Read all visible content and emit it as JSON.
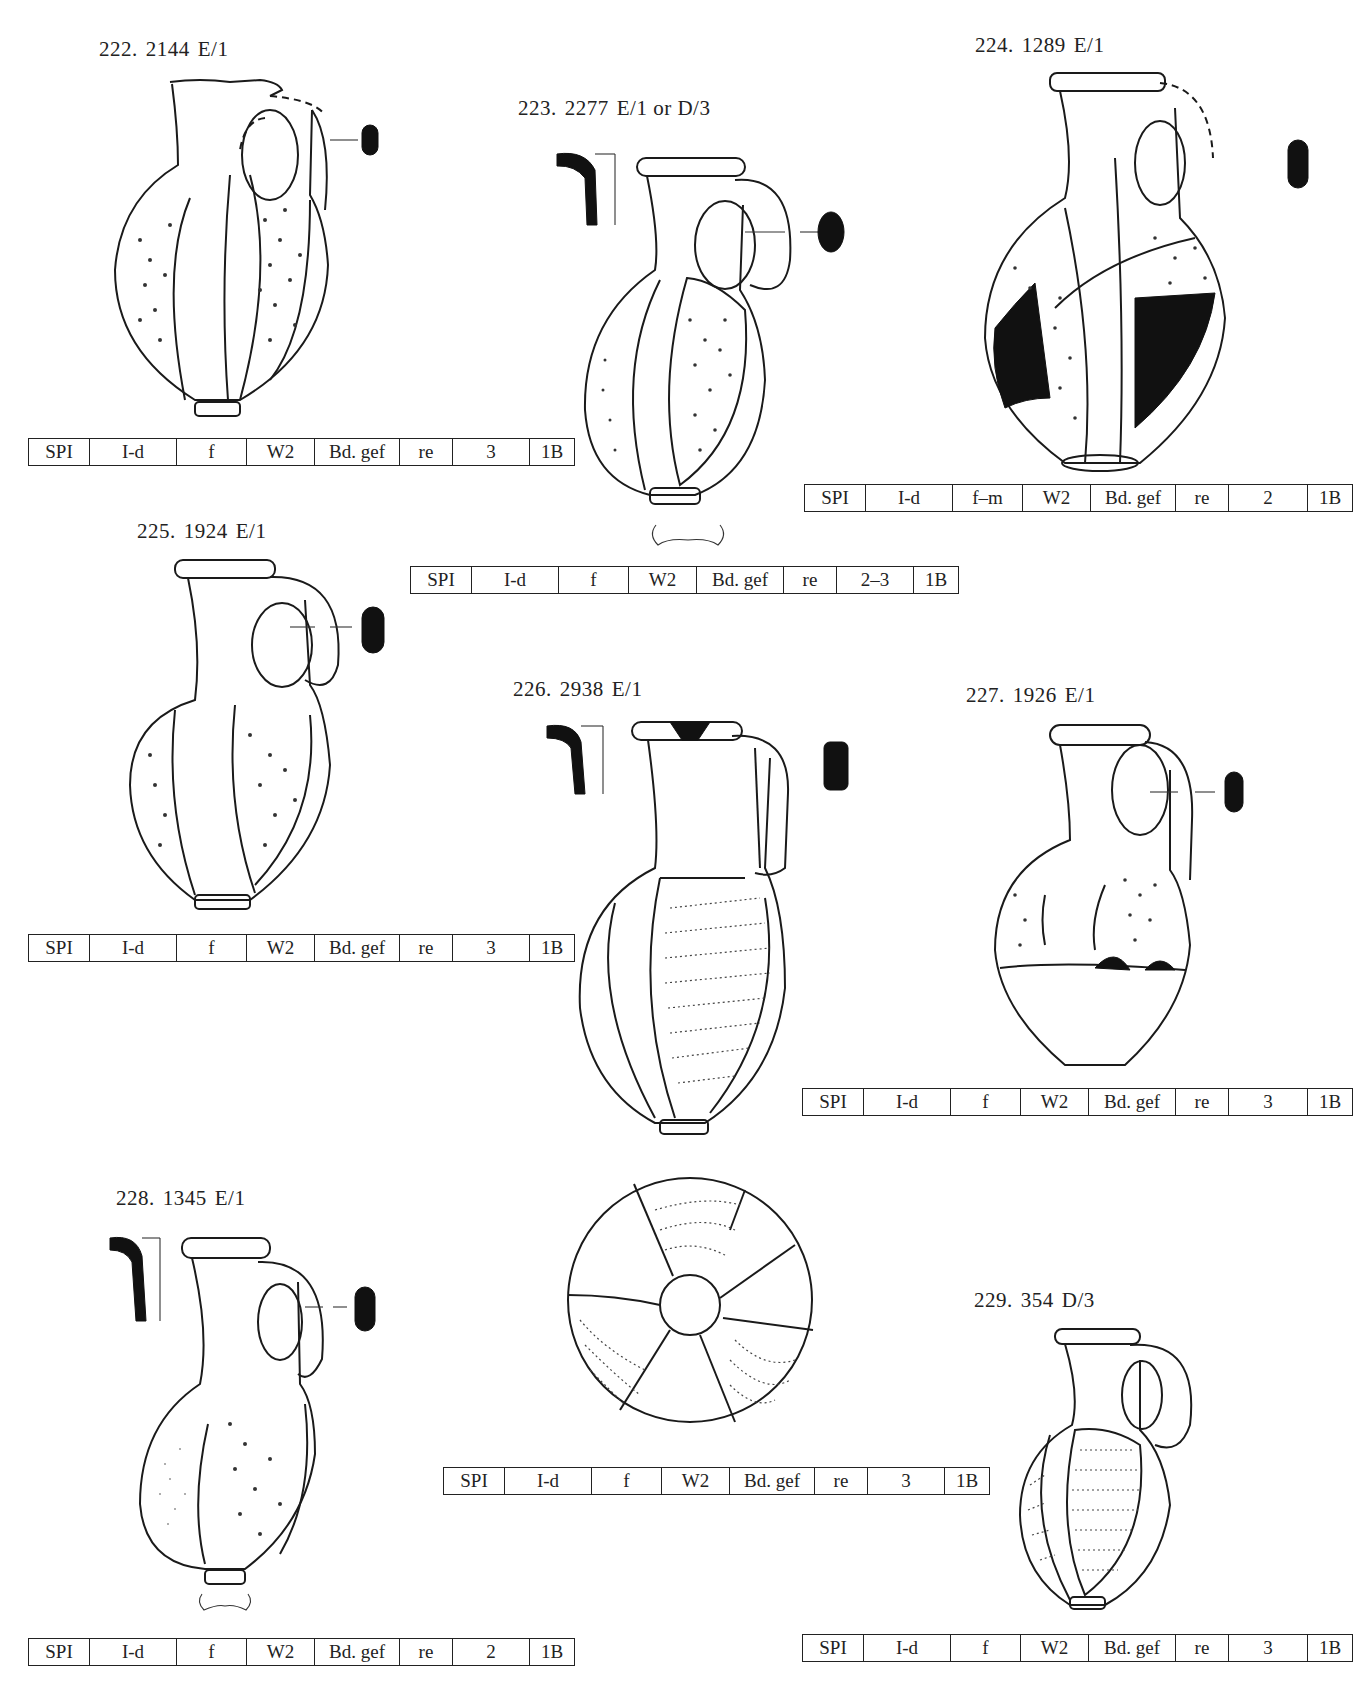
{
  "plate": {
    "catalogue": [
      {
        "id": "222",
        "inventory": "2144",
        "context": "E/1",
        "attributes": [
          "SPI",
          "I-d",
          "f",
          "W2",
          "Bd. gef",
          "re",
          "3",
          "1B"
        ]
      },
      {
        "id": "223",
        "inventory": "2277",
        "context": "E/1 or D/3",
        "attributes": [
          "SPI",
          "I-d",
          "f",
          "W2",
          "Bd. gef",
          "re",
          "2–3",
          "1B"
        ]
      },
      {
        "id": "224",
        "inventory": "1289",
        "context": "E/1",
        "attributes": [
          "SPI",
          "I-d",
          "f–m",
          "W2",
          "Bd. gef",
          "re",
          "2",
          "1B"
        ]
      },
      {
        "id": "225",
        "inventory": "1924",
        "context": "E/1",
        "attributes": [
          "SPI",
          "I-d",
          "f",
          "W2",
          "Bd. gef",
          "re",
          "3",
          "1B"
        ]
      },
      {
        "id": "226",
        "inventory": "2938",
        "context": "E/1",
        "attributes": [
          "SPI",
          "I-d",
          "f",
          "W2",
          "Bd. gef",
          "re",
          "3",
          "1B"
        ]
      },
      {
        "id": "227",
        "inventory": "1926",
        "context": "E/1",
        "attributes": [
          "SPI",
          "I-d",
          "f",
          "W2",
          "Bd. gef",
          "re",
          "3",
          "1B"
        ]
      },
      {
        "id": "228",
        "inventory": "1345",
        "context": "E/1",
        "attributes": [
          "SPI",
          "I-d",
          "f",
          "W2",
          "Bd. gef",
          "re",
          "2",
          "1B"
        ]
      },
      {
        "id": "229",
        "inventory": "354",
        "context": "D/3",
        "attributes": [
          "SPI",
          "I-d",
          "f",
          "W2",
          "Bd. gef",
          "re",
          "3",
          "1B"
        ]
      }
    ],
    "labels": {
      "n222": "222.",
      "inv222": "2144",
      "ctx222": "E/1",
      "n223": "223.",
      "inv223": "2277",
      "ctx223": "E/1 or D/3",
      "n224": "224.",
      "inv224": "1289",
      "ctx224": "E/1",
      "n225": "225.",
      "inv225": "1924",
      "ctx225": "E/1",
      "n226": "226.",
      "inv226": "2938",
      "ctx226": "E/1",
      "n227": "227.",
      "inv227": "1926",
      "ctx227": "E/1",
      "n228": "228.",
      "inv228": "1345",
      "ctx228": "E/1",
      "n229": "229.",
      "inv229": "354",
      "ctx229": "D/3"
    },
    "tables": {
      "t222": [
        "SPI",
        "I-d",
        "f",
        "W2",
        "Bd. gef",
        "re",
        "3",
        "1B"
      ],
      "t223": [
        "SPI",
        "I-d",
        "f",
        "W2",
        "Bd. gef",
        "re",
        "2–3",
        "1B"
      ],
      "t224": [
        "SPI",
        "I-d",
        "f–m",
        "W2",
        "Bd. gef",
        "re",
        "2",
        "1B"
      ],
      "t225": [
        "SPI",
        "I-d",
        "f",
        "W2",
        "Bd. gef",
        "re",
        "3",
        "1B"
      ],
      "t226": [
        "SPI",
        "I-d",
        "f",
        "W2",
        "Bd. gef",
        "re",
        "3",
        "1B"
      ],
      "t227": [
        "SPI",
        "I-d",
        "f",
        "W2",
        "Bd. gef",
        "re",
        "3",
        "1B"
      ],
      "t228": [
        "SPI",
        "I-d",
        "f",
        "W2",
        "Bd. gef",
        "re",
        "2",
        "1B"
      ],
      "t229": [
        "SPI",
        "I-d",
        "f",
        "W2",
        "Bd. gef",
        "re",
        "3",
        "1B"
      ]
    },
    "figures": {
      "vessel_type": "jug-drawing",
      "extra_views": [
        "rim-profile-section",
        "handle-section",
        "base-profile",
        "base-view-from-below"
      ]
    }
  }
}
